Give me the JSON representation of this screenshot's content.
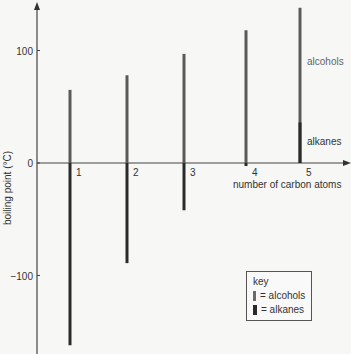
{
  "chart_data": {
    "type": "bar",
    "title": "",
    "xlabel": "number of carbon atoms",
    "ylabel": "boiling point (°C)",
    "categories": [
      "1",
      "2",
      "3",
      "4",
      "5"
    ],
    "ylim": [
      -170,
      145
    ],
    "yticks": [
      100,
      0,
      -100
    ],
    "ytick_labels": [
      "100",
      "0",
      "−100"
    ],
    "series": [
      {
        "name": "alcohols",
        "values": [
          65,
          78,
          97,
          118,
          138
        ],
        "color": "#5a5a5a"
      },
      {
        "name": "alkanes",
        "values": [
          -162,
          -89,
          -42,
          -1,
          36
        ],
        "color": "#2a2a2a"
      }
    ],
    "annotations": {
      "alcohols": "alcohols",
      "alkanes": "alkanes"
    },
    "legend": {
      "title": "key",
      "placement": "bottom-right",
      "items": [
        {
          "label": "= alcohols",
          "color": "#6a6a6a"
        },
        {
          "label": "= alkanes",
          "color": "#2a2a2a"
        }
      ]
    },
    "grid": false
  }
}
